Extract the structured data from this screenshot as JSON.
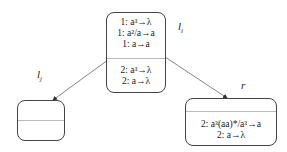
{
  "nodes": {
    "center": {
      "label": "l",
      "label_sub": "i",
      "top_rules": [
        "1: a³→λ",
        "1: a²/a→a",
        "1: a→a"
      ],
      "bottom_rules": [
        "2: a³→λ",
        "2: a→λ"
      ]
    },
    "left": {
      "label": "l",
      "label_sub": "j",
      "top_rules": [],
      "bottom_rules": []
    },
    "right": {
      "label": "r",
      "top_rules": [],
      "bottom_rules": [
        "2: a³(aa)*/a³→a",
        "2: a→λ"
      ]
    }
  },
  "edges": [
    {
      "from": "center",
      "to": "left",
      "label": "l_j"
    },
    {
      "from": "center",
      "to": "right",
      "label": "r"
    }
  ],
  "colors": {
    "stroke": "#444444",
    "divider": "#bbbbbb",
    "background": "#ffffff"
  }
}
